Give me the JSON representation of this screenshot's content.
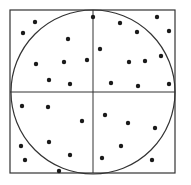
{
  "diagram": {
    "title": "",
    "square": {
      "x": 10,
      "y": 10,
      "width": 165,
      "height": 163,
      "stroke": "#333333"
    },
    "circle": {
      "cx": 93,
      "cy": 92,
      "r": 82,
      "stroke": "#333333"
    },
    "crosshair": {
      "x": 93,
      "y": 92,
      "stroke": "#333333"
    },
    "dot_color": "#1a1a1a",
    "dot_radius": 2.2,
    "points": [
      [
        35,
        22
      ],
      [
        23,
        33
      ],
      [
        68,
        39
      ],
      [
        36,
        64
      ],
      [
        64,
        62
      ],
      [
        87,
        60
      ],
      [
        49,
        80
      ],
      [
        70,
        84
      ],
      [
        93,
        17
      ],
      [
        120,
        23
      ],
      [
        137,
        32
      ],
      [
        157,
        17
      ],
      [
        169,
        31
      ],
      [
        100,
        49
      ],
      [
        129,
        62
      ],
      [
        145,
        61
      ],
      [
        161,
        56
      ],
      [
        111,
        83
      ],
      [
        138,
        86
      ],
      [
        169,
        84
      ],
      [
        22,
        106
      ],
      [
        48,
        107
      ],
      [
        82,
        121
      ],
      [
        21,
        146
      ],
      [
        49,
        142
      ],
      [
        70,
        155
      ],
      [
        25,
        160
      ],
      [
        59,
        171
      ],
      [
        105,
        115
      ],
      [
        128,
        123
      ],
      [
        155,
        128
      ],
      [
        121,
        146
      ],
      [
        102,
        158
      ],
      [
        152,
        160
      ]
    ]
  }
}
